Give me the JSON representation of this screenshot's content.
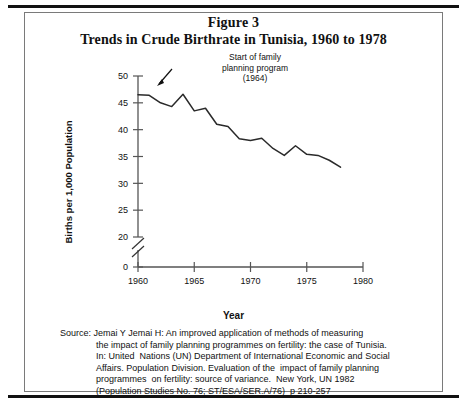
{
  "figure": {
    "title_line1": "Figure 3",
    "title_line2": "Trends in Crude Birthrate in Tunisia, 1960 to 1978"
  },
  "annotation": {
    "line1": "Start of family",
    "line2": "planning program",
    "line3": "(1964)",
    "points_to_year": 1964,
    "arrow": "arrow-down-left"
  },
  "axis": {
    "x_title": "Year",
    "y_title": "Births per 1,000 Population",
    "x_ticks": [
      "1960",
      "1965",
      "1970",
      "1975",
      "1980"
    ],
    "y_ticks": [
      "0",
      "20",
      "25",
      "30",
      "35",
      "40",
      "45",
      "50"
    ],
    "y_axis_break": true
  },
  "source": {
    "line1": "Source: Jemai Y Jemai H: An improved application of methods of measuring",
    "line2": "the impact of family planning programmes on fertility: the case of Tunisia.",
    "line3": "In: United  Nations (UN) Department of International Economic and Social",
    "line4": "Affairs. Population Division. Evaluation of the  impact of family planning",
    "line5": "programmes  on fertility: source of variance.  New York, UN 1982",
    "line6": "(Population Studies No. 76; ST/ESA/SER.A/76)  p 210-257"
  },
  "colors": {
    "line": "#2a2a2a",
    "axis": "#555555",
    "text": "#111111",
    "background": "#ffffff",
    "border": "#7a7a7a",
    "rule": "#111111"
  },
  "chart_data": {
    "type": "line",
    "title": "Trends in Crude Birthrate in Tunisia, 1960 to 1978",
    "xlabel": "Year",
    "ylabel": "Births per 1,000 Population",
    "xlim": [
      1960,
      1980
    ],
    "ylim": [
      20,
      50
    ],
    "y_axis_break_below": 20,
    "grid": false,
    "legend": "none",
    "x": [
      1960,
      1961,
      1962,
      1963,
      1964,
      1965,
      1966,
      1967,
      1968,
      1969,
      1970,
      1971,
      1972,
      1973,
      1974,
      1975,
      1976,
      1977,
      1978
    ],
    "series": [
      {
        "name": "Crude birthrate",
        "values": [
          46.5,
          46.4,
          45.0,
          44.3,
          46.6,
          43.5,
          44.0,
          41.0,
          40.6,
          38.3,
          38.0,
          38.4,
          36.5,
          35.2,
          37.0,
          35.4,
          35.2,
          34.3,
          33.0
        ]
      }
    ],
    "annotations": [
      {
        "text": "Start of family planning program (1964)",
        "x": 1964,
        "y": 46.6
      }
    ]
  }
}
